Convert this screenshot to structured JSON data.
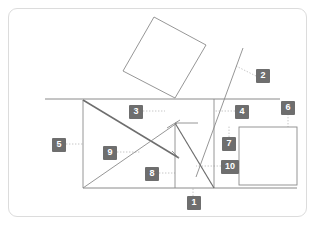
{
  "figure": {
    "title": "",
    "background_color": "#ffffff",
    "card": {
      "x": 8,
      "y": 8,
      "width": 299,
      "height": 209,
      "border_color": "#dcdcdc",
      "fill_color": "#ffffff",
      "corner_radius": 9
    },
    "stroke_color": "#8a8a8a",
    "stroke_color_bold": "#6e6e6e",
    "leader_color": "#b8b8b8",
    "callout_fill": "#6e6e6e",
    "callout_text_color": "#ffffff",
    "shapes": [
      {
        "name": "tilted-square",
        "type": "polygon",
        "points": "154,17 206,45 175,98 123,71"
      },
      {
        "name": "right-rectangle",
        "type": "rect",
        "x": 239,
        "y": 127,
        "width": 58,
        "height": 58
      },
      {
        "name": "horizontal-ground-line",
        "type": "line",
        "x1": 45,
        "y1": 99,
        "x2": 280,
        "y2": 99
      },
      {
        "name": "left-vertical-line",
        "type": "line",
        "x1": 83,
        "y1": 100,
        "x2": 83,
        "y2": 188
      },
      {
        "name": "bottom-horizontal-line",
        "type": "line",
        "x1": 83,
        "y1": 188,
        "x2": 297,
        "y2": 188
      },
      {
        "name": "mid-vertical-line",
        "type": "line",
        "x1": 175,
        "y1": 124,
        "x2": 175,
        "y2": 188
      },
      {
        "name": "right-vertical-line",
        "type": "line",
        "x1": 214,
        "y1": 99,
        "x2": 214,
        "y2": 188
      },
      {
        "name": "steep-ray",
        "type": "line",
        "x1": 196,
        "y1": 177,
        "x2": 243,
        "y2": 48
      },
      {
        "name": "bold-descending-diagonal",
        "type": "line",
        "x1": 83,
        "y1": 100,
        "x2": 179,
        "y2": 158
      },
      {
        "name": "ascending-diagonal",
        "type": "line",
        "x1": 83,
        "y1": 188,
        "x2": 177,
        "y2": 123
      },
      {
        "name": "peak-to-bottom-right-diagonal",
        "type": "line",
        "x1": 175,
        "y1": 123,
        "x2": 214,
        "y2": 188
      },
      {
        "name": "peak-left-tick",
        "type": "line",
        "x1": 167,
        "y1": 128,
        "x2": 180,
        "y2": 120
      },
      {
        "name": "peak-horizontal-tick",
        "type": "line",
        "x1": 175,
        "y1": 123,
        "x2": 198,
        "y2": 123
      },
      {
        "name": "short-spur",
        "type": "line",
        "x1": 179,
        "y1": 158,
        "x2": 172,
        "y2": 151
      }
    ],
    "leaders": [
      {
        "name": "leader-1",
        "x1": 193,
        "y1": 196,
        "x2": 193,
        "y2": 188
      },
      {
        "name": "leader-2",
        "x1": 256,
        "y1": 76,
        "x2": 236,
        "y2": 66
      },
      {
        "name": "leader-3",
        "x1": 143,
        "y1": 111,
        "x2": 165,
        "y2": 111
      },
      {
        "name": "leader-4",
        "x1": 235,
        "y1": 111,
        "x2": 214,
        "y2": 111
      },
      {
        "name": "leader-5",
        "x1": 66,
        "y1": 144,
        "x2": 83,
        "y2": 144
      },
      {
        "name": "leader-6",
        "x1": 288,
        "y1": 114,
        "x2": 288,
        "y2": 127
      },
      {
        "name": "leader-7",
        "x1": 229,
        "y1": 137,
        "x2": 229,
        "y2": 126
      },
      {
        "name": "leader-8",
        "x1": 159,
        "y1": 173,
        "x2": 175,
        "y2": 173
      },
      {
        "name": "leader-9",
        "x1": 117,
        "y1": 152,
        "x2": 141,
        "y2": 152
      },
      {
        "name": "leader-10",
        "x1": 221,
        "y1": 166,
        "x2": 196,
        "y2": 166
      }
    ],
    "callouts": [
      {
        "id": "callout-1",
        "label": "1",
        "x": 187,
        "y": 196,
        "width": 14
      },
      {
        "id": "callout-2",
        "label": "2",
        "x": 256,
        "y": 69,
        "width": 14
      },
      {
        "id": "callout-3",
        "label": "3",
        "x": 129,
        "y": 105,
        "width": 14
      },
      {
        "id": "callout-4",
        "label": "4",
        "x": 235,
        "y": 105,
        "width": 14
      },
      {
        "id": "callout-5",
        "label": "5",
        "x": 52,
        "y": 138,
        "width": 14
      },
      {
        "id": "callout-6",
        "label": "6",
        "x": 281,
        "y": 101,
        "width": 14
      },
      {
        "id": "callout-7",
        "label": "7",
        "x": 222,
        "y": 137,
        "width": 14
      },
      {
        "id": "callout-8",
        "label": "8",
        "x": 145,
        "y": 167,
        "width": 14
      },
      {
        "id": "callout-9",
        "label": "9",
        "x": 103,
        "y": 146,
        "width": 14
      },
      {
        "id": "callout-10",
        "label": "10",
        "x": 221,
        "y": 160,
        "width": 18
      }
    ]
  }
}
